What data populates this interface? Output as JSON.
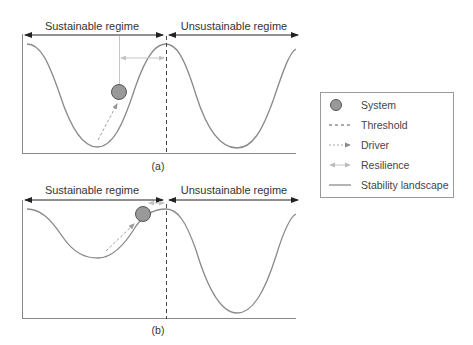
{
  "panels": [
    {
      "id": "a",
      "caption": "(a)",
      "regime_left": "Sustainable regime",
      "regime_right": "Unsustainable regime",
      "description": "System sits in a deep valley of the stability landscape, far from the threshold; resilience (distance to threshold) is large."
    },
    {
      "id": "b",
      "caption": "(b)",
      "regime_left": "Sustainable regime",
      "regime_right": "Unsustainable regime",
      "description": "Valley in the sustainable regime is shallow; the system is pushed near the peak by the driver; resilience is small."
    }
  ],
  "legend": {
    "items": [
      {
        "symbol": "circle-icon",
        "label": "System"
      },
      {
        "symbol": "dashed-line-icon",
        "label": "Threshold"
      },
      {
        "symbol": "dotted-arrow-icon",
        "label": "Driver"
      },
      {
        "symbol": "double-arrow-icon",
        "label": "Resilience"
      },
      {
        "symbol": "solid-line-icon",
        "label": "Stability landscape"
      }
    ]
  },
  "colors": {
    "curve": "#8a8a8a",
    "axis": "#777777",
    "system_fill": "#999999",
    "system_stroke": "#555555",
    "driver": "#a8a8a8",
    "resilience": "#c8c8c8",
    "arrow": "#222222"
  }
}
